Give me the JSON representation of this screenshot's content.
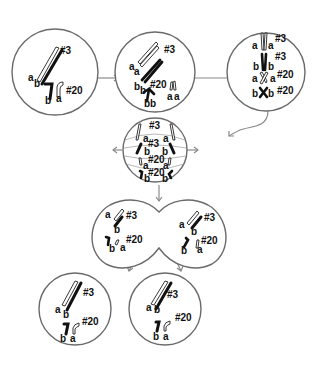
{
  "colors": {
    "outline": "#6a6a6a",
    "arrow": "#8a8a8a",
    "chromosome_dark": "#111111",
    "chromosome_light": "#ffffff"
  },
  "stages": [
    {
      "name": "interphase",
      "labels": {
        "chr3": "#3",
        "chr20": "#20",
        "a3": "a",
        "b3": "b",
        "b20": "b",
        "a20": "a"
      }
    },
    {
      "name": "prophase",
      "labels": {
        "chr3": "#3",
        "chr20": "#20",
        "a3_1": "a",
        "a3_2": "a",
        "b3_1": "b",
        "b3_2": "b",
        "b20_1": "b",
        "b20_2": "b",
        "a20_1": "a",
        "a20_2": "a"
      }
    },
    {
      "name": "metaphase",
      "labels": {
        "chr3_a": "#3",
        "chr3_b": "#3",
        "chr20_a": "#20",
        "chr20_b": "#20",
        "a1": "a",
        "a2": "a",
        "b1": "b",
        "b2": "b",
        "a3": "a",
        "a4": "a",
        "b3": "b",
        "b4": "b"
      }
    },
    {
      "name": "anaphase",
      "labels": {
        "chr3_top": "#3",
        "chr3_mid": "#3",
        "chr20_mid": "#20",
        "chr20_bot": "#20",
        "a_tl": "a",
        "a_tr": "a",
        "b_ml": "b",
        "b_mr": "b",
        "a_ll": "a",
        "a_lr": "a",
        "b_bl": "b",
        "b_br": "b"
      }
    },
    {
      "name": "telophase",
      "left": {
        "chr3": "#3",
        "chr20": "#20",
        "a3": "a",
        "b3": "b",
        "b20": "b",
        "a20": "a"
      },
      "right": {
        "chr3": "#3",
        "chr20": "#20",
        "a3": "a",
        "b3": "b",
        "b20": "b",
        "a20": "a"
      }
    },
    {
      "name": "daughter-cells",
      "left": {
        "chr3": "#3",
        "chr20": "#20",
        "a3": "a",
        "b3": "b",
        "b20": "b",
        "a20": "a"
      },
      "right": {
        "chr3": "#3",
        "chr20": "#20",
        "a3": "a",
        "b3": "b",
        "b20": "b",
        "a20": "a"
      }
    }
  ]
}
